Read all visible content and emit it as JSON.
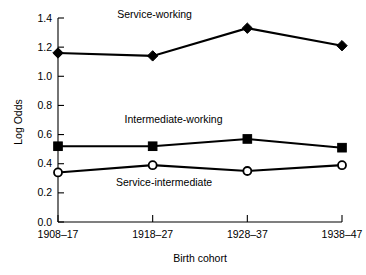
{
  "chart_data": {
    "type": "line",
    "title": "",
    "xlabel": "Birth cohort",
    "ylabel": "Log Odds",
    "categories": [
      "1908–17",
      "1918–27",
      "1928–37",
      "1938–47"
    ],
    "ylim": [
      0.0,
      1.4
    ],
    "yticks": [
      "0.0",
      "0.2",
      "0.4",
      "0.6",
      "0.8",
      "1.0",
      "1.2",
      "1.4"
    ],
    "ytick_values": [
      0.0,
      0.2,
      0.4,
      0.6,
      0.8,
      1.0,
      1.2,
      1.4
    ],
    "grid": false,
    "legend_position": "inline-annotations",
    "series": [
      {
        "name": "Service-working",
        "marker": "filled-diamond",
        "color": "#000000",
        "values": [
          1.16,
          1.14,
          1.33,
          1.21
        ]
      },
      {
        "name": "Intermediate-working",
        "marker": "filled-square",
        "color": "#000000",
        "values": [
          0.52,
          0.52,
          0.57,
          0.51
        ]
      },
      {
        "name": "Service-intermediate",
        "marker": "open-circle",
        "color": "#000000",
        "values": [
          0.34,
          0.39,
          0.35,
          0.39
        ]
      }
    ],
    "annotations": [
      {
        "text": "Service-working",
        "x": 1.02,
        "y": 1.4
      },
      {
        "text": "Intermediate-working",
        "x": 1.22,
        "y": 0.68
      },
      {
        "text": "Service-intermediate",
        "x": 1.12,
        "y": 0.25
      }
    ]
  }
}
